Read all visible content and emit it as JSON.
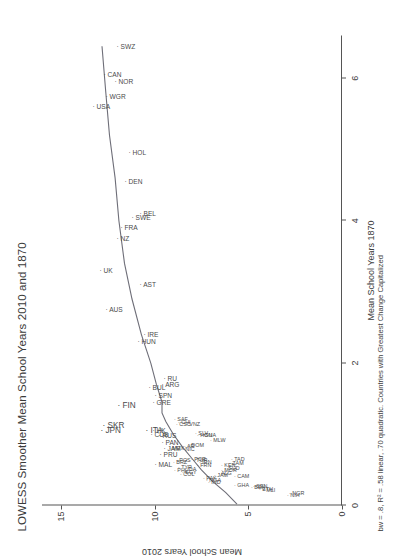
{
  "chart_data": {
    "type": "scatter",
    "title": "LOWESS Smoother Mean School Years 2010 and 1870",
    "subtitle": "bw = .8, R² = .58 linear, .70 quadratic.  Countries with Greatest Change Capitalized",
    "xlabel": "Mean School Years 1870",
    "ylabel": "Mean School Years 2010",
    "xlim": [
      0,
      6.6
    ],
    "ylim": [
      0,
      16
    ],
    "xticks": [
      0,
      2,
      4,
      6
    ],
    "yticks": [
      0,
      5,
      10,
      15
    ],
    "grid": false,
    "legend": null,
    "smoother": "lowess",
    "bandwidth": 0.8,
    "r2_linear": 0.58,
    "r2_quadratic": 0.7,
    "points": [
      {
        "label": "SWZ",
        "x": 6.45,
        "y": 12.2,
        "emph": false
      },
      {
        "label": "CAN",
        "x": 6.05,
        "y": 12.9,
        "emph": false
      },
      {
        "label": "WGR",
        "x": 5.75,
        "y": 12.8,
        "emph": false
      },
      {
        "label": "NOR",
        "x": 5.95,
        "y": 12.3,
        "emph": false
      },
      {
        "label": "USA",
        "x": 5.6,
        "y": 13.5,
        "emph": false
      },
      {
        "label": "HOL",
        "x": 4.95,
        "y": 11.6,
        "emph": false
      },
      {
        "label": "DEN",
        "x": 4.55,
        "y": 11.8,
        "emph": false
      },
      {
        "label": "BEL",
        "x": 4.1,
        "y": 11.0,
        "emph": false
      },
      {
        "label": "SWE",
        "x": 4.05,
        "y": 11.4,
        "emph": false
      },
      {
        "label": "FRA",
        "x": 3.9,
        "y": 12.0,
        "emph": false
      },
      {
        "label": "NZ",
        "x": 3.75,
        "y": 12.2,
        "emph": false
      },
      {
        "label": "UK",
        "x": 3.3,
        "y": 13.1,
        "emph": false
      },
      {
        "label": "AST",
        "x": 3.1,
        "y": 11.0,
        "emph": false
      },
      {
        "label": "AUS",
        "x": 2.75,
        "y": 12.8,
        "emph": false
      },
      {
        "label": "IRE",
        "x": 2.4,
        "y": 10.8,
        "emph": false
      },
      {
        "label": "HUN",
        "x": 2.3,
        "y": 11.1,
        "emph": false
      },
      {
        "label": "ARG",
        "x": 1.7,
        "y": 9.8,
        "emph": false
      },
      {
        "label": "RU",
        "x": 1.78,
        "y": 9.7,
        "emph": false
      },
      {
        "label": "BUL",
        "x": 1.65,
        "y": 10.5,
        "emph": false
      },
      {
        "label": "SPN",
        "x": 1.55,
        "y": 10.2,
        "emph": false
      },
      {
        "label": "GRE",
        "x": 1.45,
        "y": 10.3,
        "emph": false
      },
      {
        "label": "FIN",
        "x": 1.4,
        "y": 12.2,
        "emph": true
      },
      {
        "label": "JPN",
        "x": 1.05,
        "y": 13.1,
        "emph": true
      },
      {
        "label": "SKR",
        "x": 1.12,
        "y": 13.0,
        "emph": true
      },
      {
        "label": "ITA",
        "x": 1.05,
        "y": 10.7,
        "emph": true
      },
      {
        "label": "CUB",
        "x": 1.0,
        "y": 10.4,
        "emph": false
      },
      {
        "label": "HK",
        "x": 1.05,
        "y": 10.3,
        "emph": false
      },
      {
        "label": "RUS",
        "x": 0.98,
        "y": 10.0,
        "emph": false
      },
      {
        "label": "PAN",
        "x": 0.88,
        "y": 9.8,
        "emph": false
      },
      {
        "label": "JAM",
        "x": 0.8,
        "y": 9.7,
        "emph": false
      },
      {
        "label": "MEX",
        "x": 0.82,
        "y": 9.4,
        "emph": false
      },
      {
        "label": "PRU",
        "x": 0.72,
        "y": 9.9,
        "emph": false
      },
      {
        "label": "MAL",
        "x": 0.58,
        "y": 10.2,
        "emph": false
      },
      {
        "label": "SAF",
        "x": 1.22,
        "y": 9.1,
        "emph": false
      },
      {
        "label": "CSC",
        "x": 1.15,
        "y": 9.0,
        "emph": false
      },
      {
        "label": "CHI",
        "x": 1.18,
        "y": 8.9,
        "emph": false
      },
      {
        "label": "VNZ",
        "x": 1.15,
        "y": 8.5,
        "emph": false
      },
      {
        "label": "BRZ",
        "x": 0.62,
        "y": 9.2,
        "emph": false
      },
      {
        "label": "POS",
        "x": 0.64,
        "y": 9.0,
        "emph": false
      },
      {
        "label": "PHL",
        "x": 0.5,
        "y": 9.1,
        "emph": false
      },
      {
        "label": "TYR",
        "x": 0.55,
        "y": 8.9,
        "emph": false
      },
      {
        "label": "EGY",
        "x": 0.48,
        "y": 8.7,
        "emph": false
      },
      {
        "label": "IDA",
        "x": 0.52,
        "y": 8.6,
        "emph": false
      },
      {
        "label": "COL",
        "x": 0.45,
        "y": 8.8,
        "emph": false
      },
      {
        "label": "AR",
        "x": 0.84,
        "y": 8.6,
        "emph": false
      },
      {
        "label": "NIC",
        "x": 0.8,
        "y": 8.7,
        "emph": false
      },
      {
        "label": "DOM",
        "x": 0.86,
        "y": 8.4,
        "emph": false
      },
      {
        "label": "SLV",
        "x": 1.02,
        "y": 8.0,
        "emph": false
      },
      {
        "label": "HON",
        "x": 1.0,
        "y": 7.9,
        "emph": false
      },
      {
        "label": "GUA",
        "x": 1.0,
        "y": 7.7,
        "emph": false
      },
      {
        "label": "MLW",
        "x": 0.92,
        "y": 7.2,
        "emph": false
      },
      {
        "label": "POR",
        "x": 0.66,
        "y": 8.2,
        "emph": false
      },
      {
        "label": "TUR",
        "x": 0.64,
        "y": 8.1,
        "emph": false
      },
      {
        "label": "IRN",
        "x": 0.62,
        "y": 7.8,
        "emph": false
      },
      {
        "label": "FRN",
        "x": 0.58,
        "y": 7.9,
        "emph": false
      },
      {
        "label": "PAK",
        "x": 0.4,
        "y": 7.6,
        "emph": false
      },
      {
        "label": "NGA",
        "x": 0.36,
        "y": 7.4,
        "emph": false
      },
      {
        "label": "IND",
        "x": 0.34,
        "y": 7.3,
        "emph": false
      },
      {
        "label": "JAM2",
        "x": 0.44,
        "y": 7.0,
        "emph": false
      },
      {
        "label": "ALG",
        "x": 0.46,
        "y": 6.8,
        "emph": false
      },
      {
        "label": "MOR",
        "x": 0.5,
        "y": 6.6,
        "emph": false
      },
      {
        "label": "SUD",
        "x": 0.54,
        "y": 6.4,
        "emph": false
      },
      {
        "label": "KEN",
        "x": 0.58,
        "y": 6.6,
        "emph": false
      },
      {
        "label": "ZAM",
        "x": 0.6,
        "y": 6.2,
        "emph": false
      },
      {
        "label": "TAD",
        "x": 0.66,
        "y": 6.1,
        "emph": false
      },
      {
        "label": "CAM",
        "x": 0.42,
        "y": 5.9,
        "emph": false
      },
      {
        "label": "GHA",
        "x": 0.3,
        "y": 5.9,
        "emph": false
      },
      {
        "label": "BEN",
        "x": 0.26,
        "y": 5.0,
        "emph": false
      },
      {
        "label": "SEN",
        "x": 0.28,
        "y": 4.9,
        "emph": false
      },
      {
        "label": "ETH",
        "x": 0.24,
        "y": 4.6,
        "emph": false
      },
      {
        "label": "MLI",
        "x": 0.22,
        "y": 4.4,
        "emph": false
      },
      {
        "label": "NIH",
        "x": 0.16,
        "y": 3.1,
        "emph": false
      },
      {
        "label": "NGR",
        "x": 0.18,
        "y": 3.0,
        "emph": false
      }
    ],
    "lowess_curve": [
      {
        "x": 0.02,
        "y": 5.6
      },
      {
        "x": 0.18,
        "y": 6.2
      },
      {
        "x": 0.34,
        "y": 6.9
      },
      {
        "x": 0.5,
        "y": 7.5
      },
      {
        "x": 0.66,
        "y": 8.0
      },
      {
        "x": 0.82,
        "y": 8.5
      },
      {
        "x": 1.0,
        "y": 9.0
      },
      {
        "x": 1.18,
        "y": 9.4
      },
      {
        "x": 1.3,
        "y": 9.6
      },
      {
        "x": 1.45,
        "y": 9.6
      },
      {
        "x": 1.7,
        "y": 9.9
      },
      {
        "x": 2.0,
        "y": 10.2
      },
      {
        "x": 2.4,
        "y": 10.7
      },
      {
        "x": 2.9,
        "y": 11.2
      },
      {
        "x": 3.4,
        "y": 11.6
      },
      {
        "x": 4.0,
        "y": 11.9
      },
      {
        "x": 4.6,
        "y": 12.1
      },
      {
        "x": 5.2,
        "y": 12.4
      },
      {
        "x": 5.8,
        "y": 12.6
      },
      {
        "x": 6.45,
        "y": 12.8
      }
    ]
  }
}
